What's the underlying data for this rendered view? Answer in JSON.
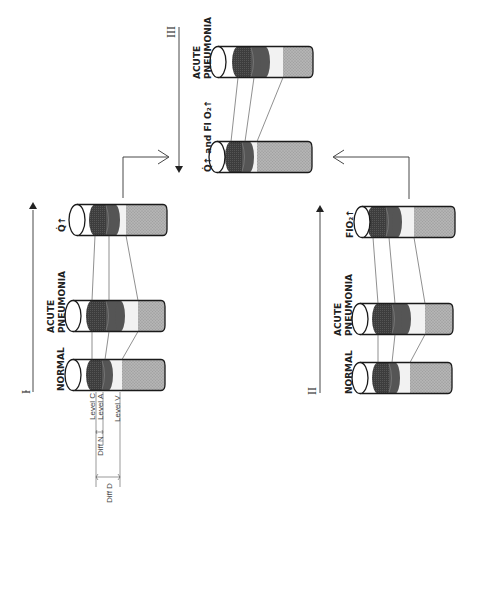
{
  "figure": {
    "sections": [
      {
        "id": "I",
        "label": "I",
        "cylinders": [
          {
            "label_lines": [
              "NORMAL"
            ],
            "x": 73,
            "cy": 375,
            "w": 92,
            "dark": [
              92,
              102
            ],
            "dark2": [
              102,
              108
            ],
            "light": [
              108,
              122
            ]
          },
          {
            "label_lines": [
              "ACUTE",
              "PNEUMONIA"
            ],
            "x": 73,
            "cy": 316,
            "w": 92,
            "dark": [
              92,
              106
            ],
            "dark2": [
              106,
              120
            ],
            "light": [
              120,
              138
            ]
          },
          {
            "label_lines": [
              "Q̇↑"
            ],
            "x": 77,
            "cy": 220,
            "w": 90,
            "dark": [
              95,
              106
            ],
            "dark2": [
              106,
              115
            ],
            "light": [
              115,
              126
            ]
          }
        ]
      },
      {
        "id": "II",
        "label": "II",
        "cylinders": [
          {
            "label_lines": [
              "NORMAL"
            ],
            "x": 360,
            "cy": 378,
            "w": 92,
            "dark": [
              378,
              389
            ],
            "dark2": [
              389,
              395
            ],
            "light": [
              395,
              410
            ]
          },
          {
            "label_lines": [
              "ACUTE",
              "PNEUMONIA"
            ],
            "x": 360,
            "cy": 319,
            "w": 93,
            "dark": [
              378,
              392
            ],
            "dark2": [
              392,
              406
            ],
            "light": [
              406,
              425
            ]
          },
          {
            "label_lines": [
              "FIO₂↑"
            ],
            "x": 362,
            "cy": 222,
            "w": 93,
            "dark": [
              373,
              386
            ],
            "dark2": [
              386,
              397
            ],
            "light": [
              397,
              414
            ]
          }
        ]
      },
      {
        "id": "III",
        "label": "III",
        "cylinders": [
          {
            "label_lines": [
              "Q̇↑ and FI O₂↑"
            ],
            "x": 217,
            "cy": 157,
            "w": 95,
            "dark": [
              231,
              242
            ],
            "dark2": [
              242,
              249
            ],
            "light": [
              249,
              257
            ]
          },
          {
            "label_lines": [
              "ACUTE",
              "PNEUMONIA"
            ],
            "x": 218,
            "cy": 62,
            "w": 95,
            "dark": [
              238,
              251
            ],
            "dark2": [
              251,
              265
            ],
            "light": [
              265,
              283
            ]
          }
        ]
      }
    ],
    "annotations": {
      "level_c": "Level C",
      "level_a": "Level A",
      "level_v": "Level V",
      "diff_n": "Diff N",
      "diff_d": "Diff D"
    },
    "colors": {
      "dark_band": "#3a3a3a",
      "dark_band_2": "#555555",
      "light_band": "#f2f2f2",
      "gray_band": "#a9a9a9",
      "outline": "#1a1a1a"
    }
  }
}
